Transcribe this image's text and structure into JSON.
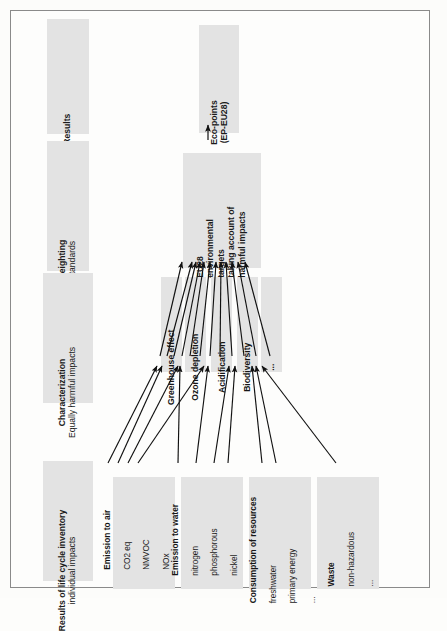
{
  "figure": {
    "orientation": "rotated-90-ccw",
    "frame_color": "#8a8a8a",
    "box_fill": "#e3e3e3"
  },
  "stages": [
    {
      "id": "results",
      "title": "Results",
      "subtitle": ""
    },
    {
      "id": "weighting",
      "title": "Weighting",
      "subtitle": "Standards"
    },
    {
      "id": "characterization",
      "title": "Characterization",
      "subtitle": "Equally harmful impacts"
    },
    {
      "id": "inventory",
      "title": "Results of life cycle inventory",
      "subtitle": "individual impacts"
    }
  ],
  "results": {
    "label_line1": "Eco-points",
    "label_line2": "(EP-EU28)"
  },
  "weighting": {
    "label_line1": "EU28",
    "label_line2": "environmental",
    "label_line3": "targets",
    "label_line4": "taking account of",
    "label_line5": "harmful impacts"
  },
  "impact_categories": [
    {
      "label": "Greenhouse effect"
    },
    {
      "label": "Ozone depletion"
    },
    {
      "label": "Acidification"
    },
    {
      "label": "Biodiversity"
    },
    {
      "label": "..."
    }
  ],
  "inventory_groups": [
    {
      "title": "Emission to air",
      "items": [
        "CO2 eq",
        "NMVOC",
        "NOx",
        "..."
      ]
    },
    {
      "title": "Emission to water",
      "items": [
        "nitrogen",
        "phosphorous",
        "nickel",
        "..."
      ]
    },
    {
      "title": "Consumption of resources",
      "items": [
        "freshwater",
        "primary energy",
        "..."
      ]
    },
    {
      "title": "Waste",
      "items": [
        "non-hazardous",
        "..."
      ]
    }
  ]
}
